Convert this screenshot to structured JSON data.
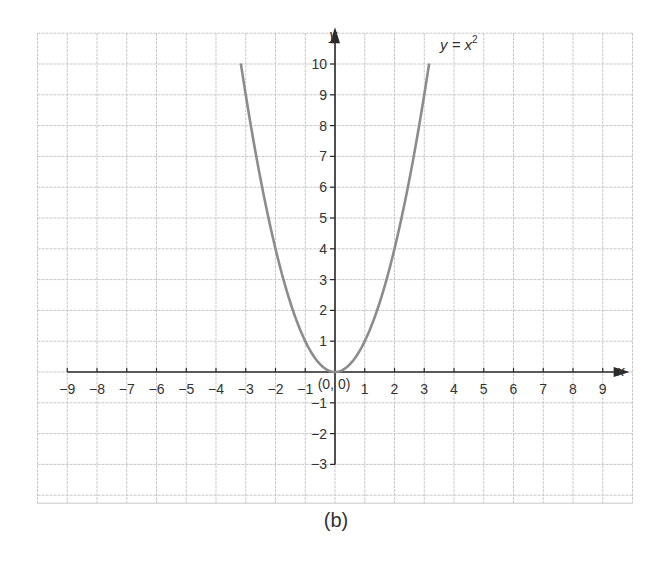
{
  "figure": {
    "caption": "(b)",
    "colors": {
      "grid": "#c8c8c8",
      "axis": "#2a2a2a",
      "curve": "#8c8c8c",
      "text": "#333333",
      "background": "#ffffff"
    }
  },
  "chart_data": {
    "type": "line",
    "title": "",
    "caption": "(b)",
    "xlabel": "x",
    "ylabel": "y",
    "series": [
      {
        "name": "y = x²",
        "label_text": "y = x",
        "label_superscript": "2",
        "function": "y = x^2",
        "x_domain": [
          -3.16,
          3.16
        ],
        "x": [
          -3.16,
          -3,
          -2.5,
          -2,
          -1.5,
          -1,
          -0.5,
          0,
          0.5,
          1,
          1.5,
          2,
          2.5,
          3,
          3.16
        ],
        "y": [
          10,
          9,
          6.25,
          4,
          2.25,
          1,
          0.25,
          0,
          0.25,
          1,
          2.25,
          4,
          6.25,
          9,
          10
        ]
      }
    ],
    "annotations": [
      {
        "text": "(0, 0)",
        "x": 0,
        "y": 0
      }
    ],
    "x_ticks": [
      -9,
      -8,
      -7,
      -6,
      -5,
      -4,
      -3,
      -2,
      -1,
      1,
      2,
      3,
      4,
      5,
      6,
      7,
      8,
      9
    ],
    "x_tick_labels": [
      "−9",
      "−8",
      "−7",
      "−6",
      "−5",
      "−4",
      "−3",
      "−2",
      "−1",
      "1",
      "2",
      "3",
      "4",
      "5",
      "6",
      "7",
      "8",
      "9"
    ],
    "y_ticks": [
      -3,
      -2,
      -1,
      1,
      2,
      3,
      4,
      5,
      6,
      7,
      8,
      9,
      10
    ],
    "y_tick_labels": [
      "−3",
      "−2",
      "−1",
      "1",
      "2",
      "3",
      "4",
      "5",
      "6",
      "7",
      "8",
      "9",
      "10"
    ],
    "xlim": [
      -10,
      10
    ],
    "ylim": [
      -4,
      11
    ],
    "x_axis_range": [
      -9,
      9.5
    ],
    "y_axis_range": [
      -3,
      10.8
    ],
    "grid": true,
    "legend": "none"
  }
}
